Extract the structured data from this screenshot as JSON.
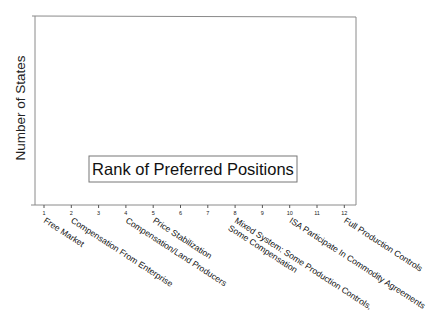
{
  "chart_data": {
    "type": "bar",
    "title": "",
    "xlabel": "",
    "ylabel": "Number of States",
    "annotation": "Rank of Preferred Positions",
    "tick_labels": [
      "1",
      "2",
      "3",
      "4",
      "5",
      "6",
      "7",
      "8",
      "9",
      "10",
      "11",
      "12"
    ],
    "categories": [
      "Free Market",
      "Compensation From Enterprise",
      "",
      "Compensation/Land Producers",
      "Price Stabilization",
      "",
      "",
      "Mixed System: Some Production Controls, Some Compensation",
      "",
      "ISA Participate In Commodity Agreements",
      "",
      "Full Production Controls"
    ],
    "category_labels_rendered": [
      {
        "tick": 1,
        "lines": [
          "Free Market"
        ]
      },
      {
        "tick": 2,
        "lines": [
          "Compensation From Enterprise"
        ]
      },
      {
        "tick": 4,
        "lines": [
          "Compensation/Land Producers"
        ]
      },
      {
        "tick": 5,
        "lines": [
          "Price Stabilization"
        ]
      },
      {
        "tick": 8,
        "lines": [
          "Mixed System: Some Production Controls,",
          "Some Compensation"
        ]
      },
      {
        "tick": 10,
        "lines": [
          "ISA Participate In Commodity Agreements"
        ]
      },
      {
        "tick": 12,
        "lines": [
          "Full Production Controls"
        ]
      }
    ],
    "values": [
      null,
      null,
      null,
      null,
      null,
      null,
      null,
      null,
      null,
      null,
      null,
      null
    ],
    "grid": false,
    "legend_position": "inside-bottom-center"
  }
}
